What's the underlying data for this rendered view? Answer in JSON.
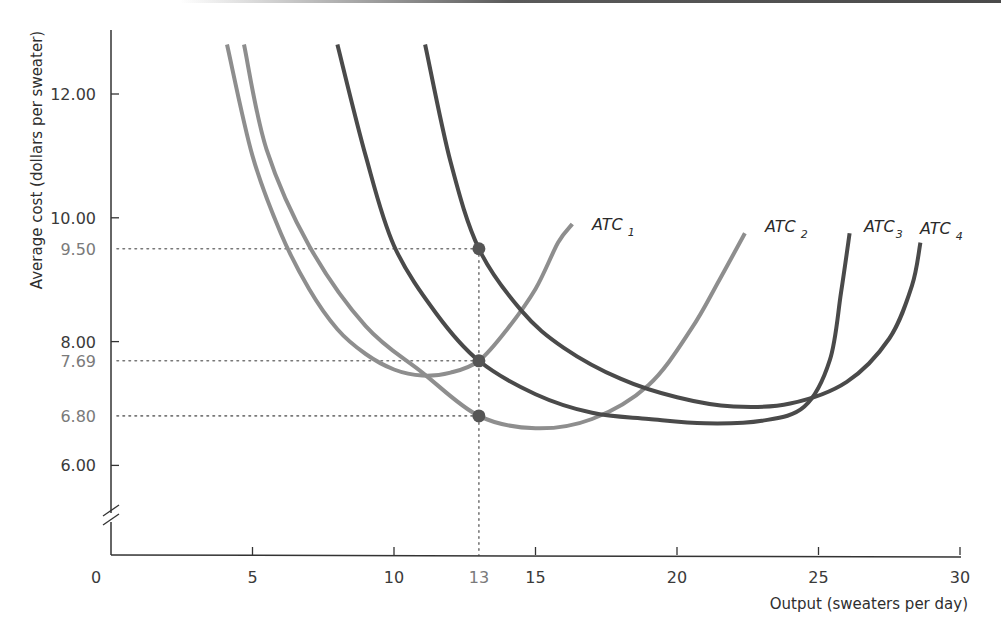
{
  "chart_data": {
    "type": "line",
    "title": "",
    "xlabel": "Output (sweaters per day)",
    "ylabel": "Average cost (dollars per sweater)",
    "xlim": [
      0,
      30
    ],
    "ylim": [
      5,
      13
    ],
    "y_axis_break": true,
    "grid": false,
    "x_ticks": [
      {
        "value": 0,
        "label": "0"
      },
      {
        "value": 5,
        "label": "5"
      },
      {
        "value": 10,
        "label": "10"
      },
      {
        "value": 13,
        "label": "13",
        "highlight": true
      },
      {
        "value": 15,
        "label": "15"
      },
      {
        "value": 20,
        "label": "20"
      },
      {
        "value": 25,
        "label": "25"
      },
      {
        "value": 30,
        "label": "30"
      }
    ],
    "y_ticks": [
      {
        "value": 12.0,
        "label": "12.00"
      },
      {
        "value": 10.0,
        "label": "10.00"
      },
      {
        "value": 9.5,
        "label": "9.50",
        "highlight": true
      },
      {
        "value": 8.0,
        "label": "8.00"
      },
      {
        "value": 7.69,
        "label": "7.69",
        "highlight": true
      },
      {
        "value": 6.8,
        "label": "6.80",
        "highlight": true
      },
      {
        "value": 6.0,
        "label": "6.00"
      }
    ],
    "series": [
      {
        "name": "ATC1",
        "label_main": "ATC",
        "label_sub": "1",
        "color": "#8e8e8e",
        "points": [
          [
            4.1,
            12.8
          ],
          [
            5,
            11.0
          ],
          [
            6,
            9.75
          ],
          [
            7,
            8.85
          ],
          [
            8,
            8.2
          ],
          [
            9,
            7.8
          ],
          [
            10,
            7.55
          ],
          [
            11,
            7.45
          ],
          [
            12,
            7.5
          ],
          [
            13,
            7.69
          ],
          [
            14,
            8.2
          ],
          [
            15,
            8.85
          ],
          [
            15.8,
            9.6
          ],
          [
            16.3,
            9.9
          ]
        ]
      },
      {
        "name": "ATC2",
        "label_main": "ATC",
        "label_sub": "2",
        "color": "#8e8e8e",
        "points": [
          [
            4.7,
            12.8
          ],
          [
            5.5,
            11.1
          ],
          [
            7,
            9.55
          ],
          [
            9,
            8.25
          ],
          [
            11,
            7.5
          ],
          [
            13,
            6.8
          ],
          [
            15,
            6.6
          ],
          [
            17,
            6.75
          ],
          [
            19,
            7.3
          ],
          [
            20.5,
            8.2
          ],
          [
            21.5,
            9.0
          ],
          [
            22.4,
            9.75
          ]
        ]
      },
      {
        "name": "ATC3",
        "label_main": "ATC",
        "label_sub": "3",
        "color": "#4a4a4a",
        "points": [
          [
            8,
            12.8
          ],
          [
            9,
            11.0
          ],
          [
            10,
            9.55
          ],
          [
            11.5,
            8.45
          ],
          [
            13,
            7.69
          ],
          [
            15,
            7.15
          ],
          [
            17,
            6.85
          ],
          [
            19,
            6.75
          ],
          [
            21,
            6.68
          ],
          [
            23,
            6.72
          ],
          [
            24.5,
            6.95
          ],
          [
            25.4,
            7.7
          ],
          [
            25.8,
            8.8
          ],
          [
            26.1,
            9.75
          ]
        ]
      },
      {
        "name": "ATC4",
        "label_main": "ATC",
        "label_sub": "4",
        "color": "#4a4a4a",
        "points": [
          [
            11.1,
            12.8
          ],
          [
            12,
            10.9
          ],
          [
            13,
            9.5
          ],
          [
            14.5,
            8.5
          ],
          [
            16,
            7.9
          ],
          [
            18,
            7.4
          ],
          [
            20,
            7.1
          ],
          [
            22,
            6.95
          ],
          [
            24,
            7.0
          ],
          [
            26,
            7.35
          ],
          [
            27.5,
            8.05
          ],
          [
            28.3,
            8.9
          ],
          [
            28.6,
            9.6
          ]
        ]
      }
    ],
    "highlight_points": [
      {
        "x": 13,
        "y": 9.5,
        "series": "ATC4"
      },
      {
        "x": 13,
        "y": 7.69,
        "series": "ATC1/ATC3"
      },
      {
        "x": 13,
        "y": 6.8,
        "series": "ATC2"
      }
    ],
    "reference_lines": [
      {
        "type": "vertical",
        "x": 13,
        "style": "dotted"
      },
      {
        "type": "horizontal",
        "y": 9.5,
        "style": "dotted",
        "x_to": 13
      },
      {
        "type": "horizontal",
        "y": 7.69,
        "style": "dotted",
        "x_to": 13
      },
      {
        "type": "horizontal",
        "y": 6.8,
        "style": "dotted",
        "x_to": 13
      }
    ],
    "colors": {
      "light_curve": "#8e8e8e",
      "dark_curve": "#4a4a4a",
      "point": "#555555",
      "axis": "#333333",
      "dotted": "#777777"
    }
  }
}
